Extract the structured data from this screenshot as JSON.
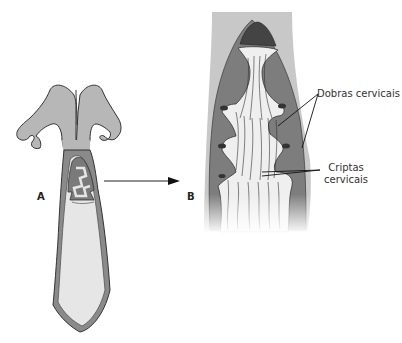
{
  "figure": {
    "panels": [
      {
        "id": "A",
        "label": "A",
        "description": "Útero com colo (corte longitudinal)"
      },
      {
        "id": "B",
        "label": "B",
        "description": "Detalhe do canal cervical ampliado"
      }
    ],
    "annotations": {
      "dobras": "Dobras cervicais",
      "criptas_line1": "Criptas",
      "criptas_line2": "cervicais"
    },
    "colors": {
      "tissue_light": "#b7b7b7",
      "tissue_dark": "#7a7a7a",
      "lumen": "#e6e6e6",
      "outline": "#333333",
      "outer_band": "#c8c8c8"
    }
  }
}
